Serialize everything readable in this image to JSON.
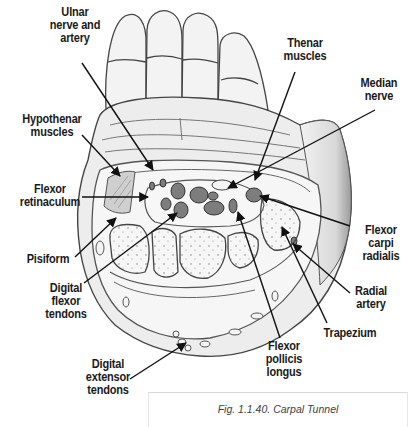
{
  "figure": {
    "caption": "Fig. 1.1.40. Carpal Tunnel"
  },
  "labels": {
    "ulnar_nerve_artery": "Ulnar\nnerve and\nartery",
    "thenar_muscles": "Thenar\nmuscles",
    "median_nerve": "Median\nnerve",
    "hypothenar_muscles": "Hypothenar\nmuscles",
    "flexor_retinaculum": "Flexor\nretinaculum",
    "pisiform": "Pisiform",
    "digital_flexor_tendons": "Digital\nflexor\ntendons",
    "flexor_carpi_radialis": "Flexor\ncarpi\nradialis",
    "radial_artery": "Radial\nartery",
    "trapezium": "Trapezium",
    "flexor_pollicis_longus": "Flexor\npollicis\nlongus",
    "digital_extensor_tendons": "Digital\nextensor\ntendons"
  },
  "colors": {
    "ink": "#1a1a1a",
    "line": "#555555",
    "skin": "#efefef",
    "tendon": "#7a7a7a",
    "bone": "#f4f4f4"
  }
}
